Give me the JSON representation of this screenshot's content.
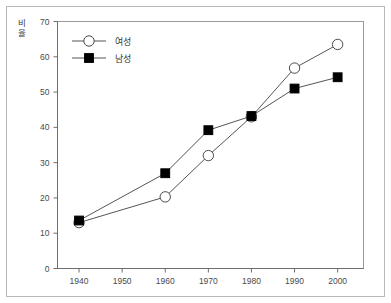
{
  "chart_data": {
    "type": "line",
    "title": "",
    "xlabel": "",
    "ylabel": "비율",
    "x": [
      1940,
      1960,
      1970,
      1980,
      1990,
      2000
    ],
    "xlim": [
      1935,
      2006
    ],
    "ylim": [
      0,
      70
    ],
    "xticks": [
      "1940",
      "1950",
      "1960",
      "1970",
      "1980",
      "1990",
      "2000"
    ],
    "xtick_values": [
      1940,
      1950,
      1960,
      1970,
      1980,
      1990,
      2000
    ],
    "yticks": [
      "0",
      "10",
      "20",
      "30",
      "40",
      "50",
      "60",
      "70"
    ],
    "ytick_values": [
      0,
      10,
      20,
      30,
      40,
      50,
      60,
      70
    ],
    "grid": false,
    "legend_position": "upper-left-inside",
    "series": [
      {
        "name": "여성",
        "marker": "open-circle",
        "color": "#000000",
        "x": [
          1940,
          1960,
          1970,
          1980,
          1990,
          2000
        ],
        "values": [
          13.0,
          20.3,
          32.0,
          43.0,
          56.8,
          63.5
        ]
      },
      {
        "name": "남성",
        "marker": "filled-square",
        "color": "#000000",
        "x": [
          1940,
          1960,
          1970,
          1980,
          1990,
          2000
        ],
        "values": [
          13.6,
          27.0,
          39.2,
          43.2,
          51.0,
          54.2
        ]
      }
    ]
  },
  "axes": {
    "y_label_chars": [
      "비",
      "율"
    ]
  },
  "legend": {
    "entries": [
      {
        "label": "여성",
        "marker": "open-circle"
      },
      {
        "label": "남성",
        "marker": "filled-square"
      }
    ]
  }
}
